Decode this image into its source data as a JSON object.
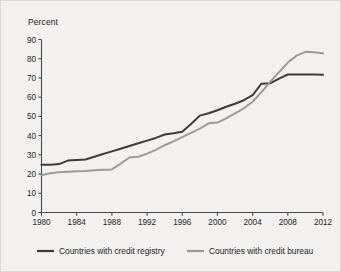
{
  "figure": {
    "background_color": "#f2f1f0",
    "border_color": "#d9d8d6"
  },
  "chart_data": {
    "type": "line",
    "title": "",
    "subtitle": "",
    "xlabel": "",
    "ylabel": "Percent",
    "ylabel_position": "top-left",
    "xlim": [
      1980,
      2012
    ],
    "ylim": [
      0,
      90
    ],
    "y_ticks": [
      0,
      10,
      20,
      30,
      40,
      50,
      60,
      70,
      80,
      90
    ],
    "x_ticks": [
      1980,
      1984,
      1988,
      1992,
      1996,
      2000,
      2004,
      2008,
      2012
    ],
    "x_tick_labels": [
      "1980",
      "1984",
      "1988",
      "1992",
      "1996",
      "2000",
      "2004",
      "2008",
      "2012"
    ],
    "y_tick_labels": [
      "0",
      "10",
      "20",
      "30",
      "40",
      "50",
      "60",
      "70",
      "80",
      "90"
    ],
    "grid": false,
    "legend_position": "bottom",
    "x": [
      1980,
      1981,
      1982,
      1983,
      1984,
      1985,
      1986,
      1987,
      1988,
      1989,
      1990,
      1991,
      1992,
      1993,
      1994,
      1995,
      1996,
      1997,
      1998,
      1999,
      2000,
      2001,
      2002,
      2003,
      2004,
      2005,
      2006,
      2007,
      2008,
      2009,
      2010,
      2011,
      2012
    ],
    "series": [
      {
        "name": "Countries with credit registry",
        "color": "#3b3b3b",
        "values": [
          24.8,
          24.8,
          25.2,
          27.0,
          27.3,
          27.6,
          29.0,
          30.4,
          31.8,
          33.2,
          34.6,
          36.0,
          37.4,
          38.8,
          40.6,
          41.2,
          42.0,
          46.0,
          50.4,
          51.6,
          53.2,
          55.0,
          56.6,
          58.4,
          61.0,
          67.0,
          67.2,
          69.6,
          71.8,
          71.8,
          71.8,
          71.8,
          71.6
        ]
      },
      {
        "name": "Countries with credit bureau",
        "color": "#9a9a9a",
        "values": [
          19.4,
          20.4,
          21.0,
          21.2,
          21.4,
          21.6,
          22.0,
          22.2,
          22.4,
          25.4,
          28.6,
          29.0,
          30.6,
          32.6,
          35.0,
          37.0,
          39.2,
          41.4,
          43.6,
          46.4,
          46.8,
          49.0,
          51.6,
          54.2,
          57.6,
          62.6,
          68.0,
          73.0,
          78.0,
          81.6,
          83.6,
          83.4,
          82.8
        ]
      }
    ]
  },
  "legend": {
    "items": [
      {
        "label": "Countries with credit registry",
        "color": "#3b3b3b"
      },
      {
        "label": "Countries with credit bureau",
        "color": "#9a9a9a"
      }
    ]
  }
}
